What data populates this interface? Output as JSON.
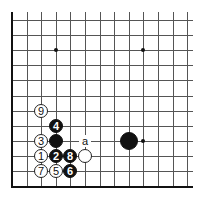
{
  "board": {
    "origin_x": 12,
    "origin_y": 20,
    "spacing_x": 14.6,
    "spacing_y": 15.1,
    "columns": 13,
    "rows": 12,
    "top_overhang": 8,
    "right_extent": 193,
    "line_color": "#555555",
    "edge_color": "#111111",
    "star_points": [
      {
        "col": 3,
        "row": 2
      },
      {
        "col": 9,
        "row": 2
      },
      {
        "col": 9,
        "row": 8
      }
    ]
  },
  "stones": [
    {
      "color": "white",
      "col": 2,
      "row": 6,
      "label": "9"
    },
    {
      "color": "black",
      "col": 3,
      "row": 7,
      "label": "4"
    },
    {
      "color": "white",
      "col": 2,
      "row": 8,
      "label": "3"
    },
    {
      "color": "black",
      "col": 3,
      "row": 8,
      "label": ""
    },
    {
      "color": "white",
      "col": 2,
      "row": 9,
      "label": "1"
    },
    {
      "color": "black",
      "col": 3,
      "row": 9,
      "label": "2"
    },
    {
      "color": "black",
      "col": 4,
      "row": 9,
      "label": "8"
    },
    {
      "color": "white",
      "col": 5,
      "row": 9,
      "label": ""
    },
    {
      "color": "white",
      "col": 2,
      "row": 10,
      "label": "7"
    },
    {
      "color": "white",
      "col": 3,
      "row": 10,
      "label": "5"
    },
    {
      "color": "black",
      "col": 4,
      "row": 10,
      "label": "6"
    },
    {
      "color": "black",
      "col": 8,
      "row": 8,
      "label": "",
      "big": true
    }
  ],
  "markers": [
    {
      "col": 5,
      "row": 8,
      "label": "a"
    }
  ]
}
